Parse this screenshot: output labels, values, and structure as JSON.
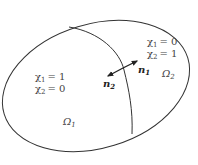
{
  "diagram": {
    "colors": {
      "stroke": "#333333",
      "text": "#444444",
      "arrow": "#222222",
      "background": "#ffffff"
    },
    "regions": [
      {
        "id": "omega1",
        "name": "Ω",
        "sub": "1",
        "indicators": [
          {
            "chi": "χ",
            "sub": "1",
            "eq": "= 1"
          },
          {
            "chi": "χ",
            "sub": "2",
            "eq": "= 0"
          }
        ]
      },
      {
        "id": "omega2",
        "name": "Ω",
        "sub": "2",
        "indicators": [
          {
            "chi": "χ",
            "sub": "1",
            "eq": "= 0"
          },
          {
            "chi": "χ",
            "sub": "2",
            "eq": "= 1"
          }
        ]
      }
    ],
    "normals": [
      {
        "id": "n1",
        "name": "n",
        "sub": "1",
        "direction": "outward from Ω1 into Ω2"
      },
      {
        "id": "n2",
        "name": "n",
        "sub": "2",
        "direction": "outward from Ω2 into Ω1"
      }
    ]
  }
}
